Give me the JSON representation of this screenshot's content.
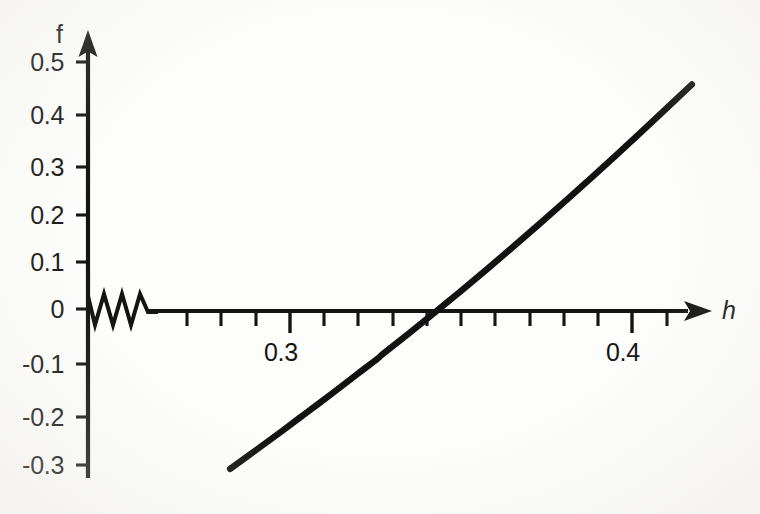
{
  "figure": {
    "kind": "scanned-function-plot",
    "background_color": "#fdfdfb",
    "ink_color": "#141414"
  },
  "axes": {
    "y_axis_name": "f",
    "x_axis_name": "h",
    "x_axis_break_marker": "zigzag",
    "x_arrow": "right-arrow",
    "y_arrow": "up-arrow"
  },
  "chart_data": {
    "type": "line",
    "title": "",
    "xlabel": "h",
    "ylabel": "f",
    "grid": false,
    "legend": false,
    "axis_break": {
      "axis": "x",
      "style": "zigzag",
      "note": "horizontal axis is broken just right of the origin; x values resume near 0.27"
    },
    "xlim": [
      0.268,
      0.452
    ],
    "ylim": [
      -0.32,
      0.53
    ],
    "xticks_major": [
      0.3,
      0.4
    ],
    "xtick_labels": [
      "0.3",
      "0.4"
    ],
    "xticks_minor_step": 0.01,
    "yticks": [
      -0.3,
      -0.2,
      -0.1,
      0,
      0.1,
      0.2,
      0.3,
      0.4,
      0.5
    ],
    "ytick_labels": [
      "-0.3",
      "-0.2",
      "-0.1",
      "0",
      "0.1",
      "0.2",
      "0.3",
      "0.4",
      "0.5"
    ],
    "root": 0.3255,
    "series": [
      {
        "name": "f(h)",
        "x": [
          0.2825,
          0.29,
          0.2975,
          0.305,
          0.3125,
          0.32,
          0.3255,
          0.3275,
          0.335,
          0.3425,
          0.35,
          0.3575,
          0.365,
          0.3725,
          0.38,
          0.3875,
          0.395,
          0.4025,
          0.41,
          0.4175,
          0.425,
          0.4325,
          0.44
        ],
        "y": [
          -0.3235,
          -0.286,
          -0.248,
          -0.209,
          -0.17,
          -0.13,
          -0.101,
          -0.089,
          -0.048,
          -0.006,
          0.0365,
          0.08,
          0.1245,
          0.1695,
          0.2155,
          0.262,
          0.309,
          0.357,
          0.4055,
          0.4545,
          0.5045,
          0.5055,
          0.506
        ]
      }
    ]
  }
}
